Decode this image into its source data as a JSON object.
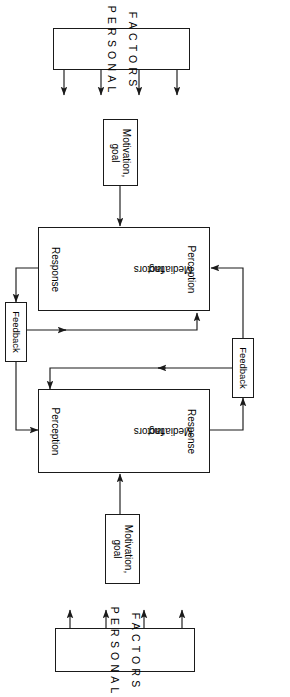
{
  "figure": {
    "orientation": "rotated-90-clockwise",
    "ink_color": "#1a1a1a",
    "background": "#ffffff"
  },
  "plates": {
    "top": {
      "line1": "FACTORS",
      "line2": "PERSONAL",
      "arrow_count": 4
    },
    "bottom": {
      "line1": "FACTORS",
      "line2": "PERSONAL",
      "arrow_count": 4
    }
  },
  "motivation_top": {
    "line1": "Motivation,",
    "line2": "goal"
  },
  "motivation_bottom": {
    "line1": "Motivation,",
    "line2": "goal"
  },
  "stage_top": {
    "cells": [
      {
        "label": "Response"
      },
      {
        "label_line1": "Mediating",
        "label_line2": "factors"
      },
      {
        "label": "Perception"
      }
    ]
  },
  "stage_bottom": {
    "cells": [
      {
        "label": "Perception"
      },
      {
        "label_line1": "Mediating",
        "label_line2": "factors"
      },
      {
        "label": "Response"
      }
    ]
  },
  "feedback_left": {
    "label": "Feedback"
  },
  "feedback_right": {
    "label": "Feedback"
  }
}
